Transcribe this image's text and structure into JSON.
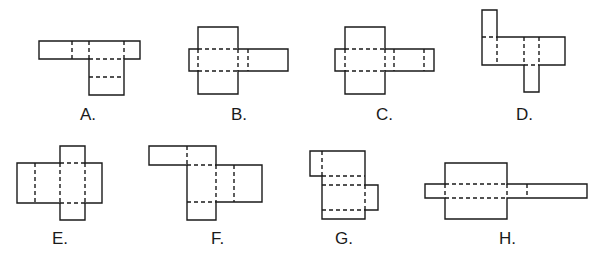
{
  "figures": [
    {
      "id": "A",
      "label": "A.",
      "label_pos": [
        89,
        120
      ]
    },
    {
      "id": "B",
      "label": "B.",
      "label_pos": [
        240,
        120
      ]
    },
    {
      "id": "C",
      "label": "C.",
      "label_pos": [
        385,
        120
      ]
    },
    {
      "id": "D",
      "label": "D.",
      "label_pos": [
        525,
        120
      ]
    },
    {
      "id": "E",
      "label": "E.",
      "label_pos": [
        60,
        244
      ]
    },
    {
      "id": "F",
      "label": "F.",
      "label_pos": [
        218,
        244
      ]
    },
    {
      "id": "G",
      "label": "G.",
      "label_pos": [
        343,
        244
      ]
    },
    {
      "id": "H",
      "label": "H.",
      "label_pos": [
        509,
        244
      ]
    }
  ],
  "colors": {
    "stroke": "#1a1a1a",
    "background": "#ffffff"
  }
}
